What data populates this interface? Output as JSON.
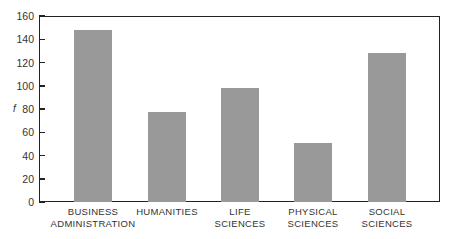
{
  "chart_data": {
    "type": "bar",
    "title": "",
    "xlabel": "",
    "ylabel": "f",
    "ylim": [
      0,
      160
    ],
    "yticks": [
      0,
      20,
      40,
      60,
      80,
      100,
      120,
      140,
      160
    ],
    "grid": false,
    "legend": null,
    "categories": [
      "BUSINESS ADMINISTRATION",
      "HUMANITIES",
      "LIFE SCIENCES",
      "PHYSICAL SCIENCES",
      "SOCIAL SCIENCES"
    ],
    "category_lines": [
      [
        "BUSINESS",
        "ADMINISTRATION"
      ],
      [
        "HUMANITIES"
      ],
      [
        "LIFE",
        "SCIENCES"
      ],
      [
        "PHYSICAL",
        "SCIENCES"
      ],
      [
        "SOCIAL",
        "SCIENCES"
      ]
    ],
    "values": [
      148,
      77,
      98,
      51,
      128
    ],
    "bar_color": "#999999"
  }
}
